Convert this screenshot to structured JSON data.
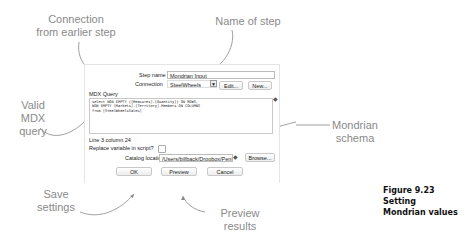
{
  "annotations": {
    "connection": "Connection from earlier step",
    "name_of_step": "Name of step",
    "valid_mdx": "Valid MDX query",
    "mondrian_schema": "Mondrian schema",
    "save_settings": "Save settings",
    "preview_results": "Preview results"
  },
  "dialog": {
    "step_name_label": "Step name",
    "step_name_value": "Mondrian Input",
    "connection_label": "Connection",
    "connection_value": "SteelWheels",
    "edit_button": "Edit...",
    "new_button": "New...",
    "mdx_label": "MDX Query",
    "mdx_lines": [
      "select NON EMPTY {[Measures].[Quantity]} ON ROWS,",
      " NON EMPTY [Markets].[Territory].Members ON COLUMNS",
      " from [SteelWheelsSales]"
    ],
    "cursor_position": "Line 3 column 24",
    "replace_variable_label": "Replace variable in script?",
    "catalog_label": "Catalog location",
    "catalog_value": "/Users/billback/Dropbox/Pent",
    "browse_button": "Browse...",
    "ok_button": "OK",
    "preview_button": "Preview",
    "cancel_button": "Cancel"
  },
  "caption": {
    "figure_number": "Figure 9.23",
    "title_line1": "Setting",
    "title_line2": "Mondrian values"
  }
}
